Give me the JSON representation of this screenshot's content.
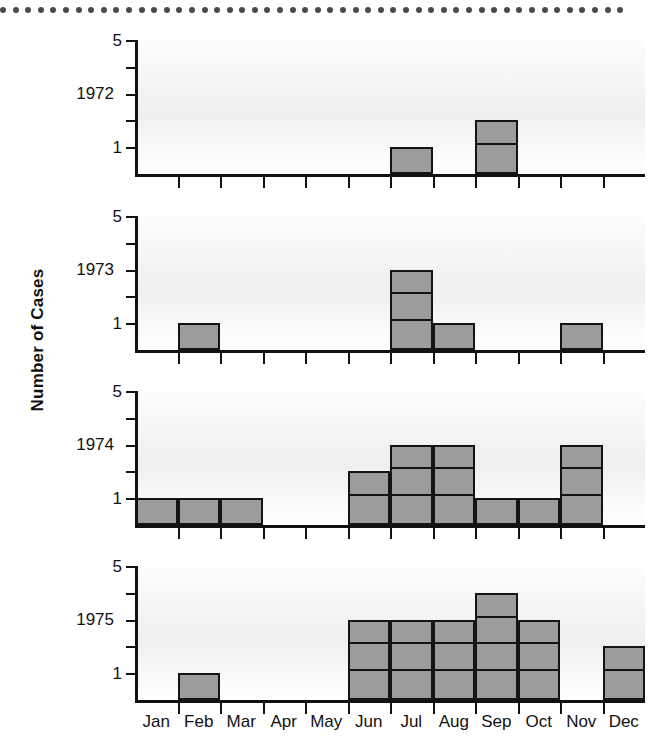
{
  "figure": {
    "y_axis_title": "Number of Cases",
    "border_dots_count": 50,
    "bar_color": "#9c9c9c",
    "line_color": "#141414"
  },
  "chart_data": {
    "type": "bar",
    "title": "",
    "subtitle": "",
    "xlabel": "",
    "ylabel": "Number of Cases",
    "ylim": [
      0,
      5
    ],
    "ytick_values": [
      1,
      2,
      3,
      4,
      5
    ],
    "ytick_labels": [
      "1",
      "",
      "",
      "",
      "5"
    ],
    "grid": false,
    "legend": "none",
    "layout": "4 stacked panels, one per year, shared monthly x-axis",
    "categories": [
      "Jan",
      "Feb",
      "Mar",
      "Apr",
      "May",
      "Jun",
      "Jul",
      "Aug",
      "Sep",
      "Oct",
      "Nov",
      "Dec"
    ],
    "series": [
      {
        "name": "1972",
        "values": [
          0,
          0,
          0,
          0,
          0,
          0,
          1,
          0,
          2,
          0,
          0,
          0
        ]
      },
      {
        "name": "1973",
        "values": [
          0,
          1,
          0,
          0,
          0,
          0,
          3,
          1,
          0,
          0,
          1,
          0
        ]
      },
      {
        "name": "1974",
        "values": [
          1,
          1,
          1,
          0,
          0,
          2,
          3,
          3,
          1,
          1,
          3,
          0
        ]
      },
      {
        "name": "1975",
        "values": [
          0,
          1,
          0,
          0,
          0,
          3,
          3,
          3,
          4,
          3,
          0,
          2
        ]
      }
    ]
  },
  "panels": [
    {
      "year": "1972"
    },
    {
      "year": "1973"
    },
    {
      "year": "1974"
    },
    {
      "year": "1975"
    }
  ]
}
